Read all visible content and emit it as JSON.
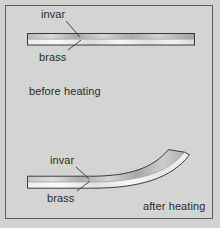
{
  "figure": {
    "background_color": "#d2d2d2",
    "frame_color": "#5c5c5c",
    "text_color": "#2b2b2b"
  },
  "panels": [
    {
      "id": "before",
      "caption": "before heating",
      "state": "straight",
      "labels": [
        {
          "name": "invar",
          "text": "invar",
          "layer": "top"
        },
        {
          "name": "brass",
          "text": "brass",
          "layer": "bottom"
        }
      ]
    },
    {
      "id": "after",
      "caption": "after heating",
      "state": "curved-upward",
      "labels": [
        {
          "name": "invar",
          "text": "invar",
          "layer": "top"
        },
        {
          "name": "brass",
          "text": "brass",
          "layer": "bottom"
        }
      ]
    }
  ],
  "strip": {
    "top_material": "invar",
    "bottom_material": "brass",
    "outline_color": "#3c3c3c",
    "fill_light": "#f2f2f2",
    "fill_mid": "#c9c9c9",
    "fill_dark": "#9a9a9a"
  }
}
